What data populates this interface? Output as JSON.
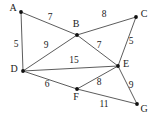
{
  "figure": {
    "kind": "weighted-undirected-graph",
    "width": 154,
    "height": 122,
    "background_color": "#ffffff",
    "edge_color": "#4a4a4a",
    "node_color": "#111111",
    "text_color": "#1a1a1a"
  },
  "nodes": [
    {
      "id": "A",
      "label": "A",
      "x": 21,
      "y": 12,
      "label_x": 13,
      "label_y": 11
    },
    {
      "id": "B",
      "label": "B",
      "x": 77,
      "y": 35,
      "label_x": 76,
      "label_y": 27
    },
    {
      "id": "C",
      "label": "C",
      "x": 136,
      "y": 17,
      "label_x": 144,
      "label_y": 17
    },
    {
      "id": "D",
      "label": "D",
      "x": 23,
      "y": 71,
      "label_x": 14,
      "label_y": 72
    },
    {
      "id": "E",
      "label": "E",
      "x": 118,
      "y": 66,
      "label_x": 126,
      "label_y": 67
    },
    {
      "id": "F",
      "label": "F",
      "x": 77,
      "y": 89,
      "label_x": 76,
      "label_y": 100
    },
    {
      "id": "G",
      "label": "G",
      "x": 137,
      "y": 104,
      "label_x": 144,
      "label_y": 112
    }
  ],
  "edges": [
    {
      "id": "A-B",
      "source": "A",
      "target": "B",
      "weight": "7",
      "label_x": 50,
      "label_y": 20
    },
    {
      "id": "A-D",
      "source": "A",
      "target": "D",
      "weight": "5",
      "label_x": 16,
      "label_y": 47
    },
    {
      "id": "B-C",
      "source": "B",
      "target": "C",
      "weight": "8",
      "label_x": 104,
      "label_y": 17
    },
    {
      "id": "B-D",
      "source": "B",
      "target": "D",
      "weight": "9",
      "label_x": 46,
      "label_y": 48
    },
    {
      "id": "B-E",
      "source": "B",
      "target": "E",
      "weight": "7",
      "label_x": 99,
      "label_y": 48
    },
    {
      "id": "C-E",
      "source": "C",
      "target": "E",
      "weight": "5",
      "label_x": 131,
      "label_y": 44
    },
    {
      "id": "D-E",
      "source": "D",
      "target": "E",
      "weight": "15",
      "label_x": 74,
      "label_y": 63
    },
    {
      "id": "D-F",
      "source": "D",
      "target": "F",
      "weight": "6",
      "label_x": 47,
      "label_y": 87
    },
    {
      "id": "E-F",
      "source": "E",
      "target": "F",
      "weight": "8",
      "label_x": 99,
      "label_y": 85
    },
    {
      "id": "E-G",
      "source": "E",
      "target": "G",
      "weight": "9",
      "label_x": 131,
      "label_y": 88
    },
    {
      "id": "F-G",
      "source": "F",
      "target": "G",
      "weight": "11",
      "label_x": 104,
      "label_y": 107
    }
  ]
}
